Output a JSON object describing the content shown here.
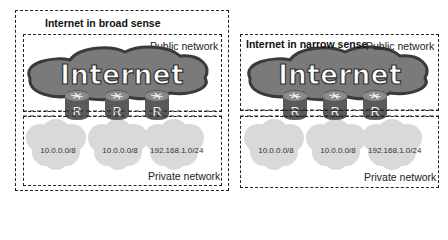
{
  "panels": [
    {
      "id": "broad",
      "title": "Internet in broad sense",
      "public_label": "Public network",
      "private_label": "Private network",
      "cloud_label": "Internet",
      "routers": [
        "R",
        "R",
        "R"
      ],
      "private_networks": [
        "10.0.0.0/8",
        "10.0.0.0/8",
        "192.168.1.0/24"
      ]
    },
    {
      "id": "narrow",
      "title": "Internet in narrow sense",
      "public_label": "Public network",
      "private_label": "Private network",
      "cloud_label": "Internet",
      "routers": [
        "R",
        "R",
        "R"
      ],
      "private_networks": [
        "10.0.0.0/8",
        "10.0.0.0/8",
        "192.168.1.0/24"
      ]
    }
  ],
  "colors": {
    "internet_cloud_fill": "#7a7a7a",
    "internet_cloud_outline": "#3a3a3a",
    "private_cloud_fill": "#d9d9d9",
    "router_fill": "#5a5a5a",
    "dashed_border": "#222222"
  }
}
